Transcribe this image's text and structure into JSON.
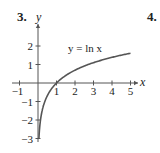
{
  "problem_numbers": [
    "3.",
    "4."
  ],
  "chart_data": {
    "type": "line",
    "title": "",
    "function": "y = ln x",
    "annotation": "y = ln x",
    "xlabel": "x",
    "ylabel": "y",
    "xlim": [
      -1.3,
      5.4
    ],
    "ylim": [
      -3.1,
      3.3
    ],
    "x_ticks": [
      -1,
      1,
      2,
      3,
      4,
      5
    ],
    "y_ticks": [
      -3,
      -2,
      -1,
      1,
      2
    ],
    "x_tick_labels": [
      "−1",
      "1",
      "2",
      "3",
      "4",
      "5"
    ],
    "y_tick_labels": [
      "−3",
      "−2",
      "−1",
      "1",
      "2"
    ],
    "grid": false,
    "legend": null,
    "series": [
      {
        "name": "y = ln x",
        "x": [
          0.05,
          0.1,
          0.2,
          0.3,
          0.5,
          0.75,
          1,
          1.5,
          2,
          2.5,
          3,
          3.5,
          4,
          4.5,
          5
        ],
        "y": [
          -3.0,
          -2.303,
          -1.609,
          -1.204,
          -0.693,
          -0.288,
          0,
          0.405,
          0.693,
          0.916,
          1.099,
          1.253,
          1.386,
          1.504,
          1.609
        ]
      }
    ]
  },
  "colors": {
    "axis": "#555555",
    "curve": "#555555",
    "text": "#222222"
  }
}
